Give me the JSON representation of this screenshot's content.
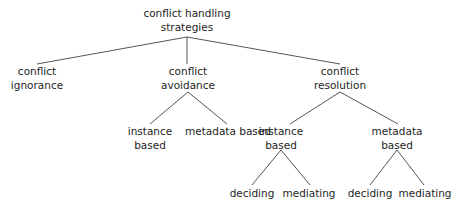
{
  "diagram": {
    "type": "tree",
    "colors": {
      "text": "#1e1e1e",
      "edge": "#555555",
      "background": "#ffffff"
    },
    "nodes": [
      {
        "id": "root",
        "lines": [
          "conflict handling",
          "strategies"
        ]
      },
      {
        "id": "ignorance",
        "lines": [
          "conflict",
          "ignorance"
        ]
      },
      {
        "id": "avoidance",
        "lines": [
          "conflict",
          "avoidance"
        ]
      },
      {
        "id": "resolution",
        "lines": [
          "conflict",
          "resolution"
        ]
      },
      {
        "id": "avoid-instance",
        "lines": [
          "instance",
          "based"
        ]
      },
      {
        "id": "avoid-metadata",
        "lines": [
          "metadata based"
        ]
      },
      {
        "id": "res-instance",
        "lines": [
          "instance",
          "based"
        ]
      },
      {
        "id": "res-metadata",
        "lines": [
          "metadata",
          "based"
        ]
      },
      {
        "id": "res-inst-deciding",
        "lines": [
          "deciding"
        ]
      },
      {
        "id": "res-inst-mediating",
        "lines": [
          "mediating"
        ]
      },
      {
        "id": "res-meta-deciding",
        "lines": [
          "deciding"
        ]
      },
      {
        "id": "res-meta-mediating",
        "lines": [
          "mediating"
        ]
      }
    ],
    "edges": [
      [
        "root",
        "ignorance"
      ],
      [
        "root",
        "avoidance"
      ],
      [
        "root",
        "resolution"
      ],
      [
        "avoidance",
        "avoid-instance"
      ],
      [
        "avoidance",
        "avoid-metadata"
      ],
      [
        "resolution",
        "res-instance"
      ],
      [
        "resolution",
        "res-metadata"
      ],
      [
        "res-instance",
        "res-inst-deciding"
      ],
      [
        "res-instance",
        "res-inst-mediating"
      ],
      [
        "res-metadata",
        "res-meta-deciding"
      ],
      [
        "res-metadata",
        "res-meta-mediating"
      ]
    ]
  }
}
